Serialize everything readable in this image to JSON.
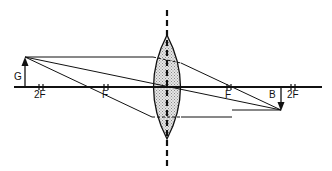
{
  "diagram": {
    "labels": {
      "object": "G",
      "image": "B",
      "focal_left": "F",
      "focal_right": "F",
      "double_focal_left": "2F",
      "double_focal_right": "2F"
    },
    "colors": {
      "line": "#111111",
      "lens_fill": "#cfcfcf",
      "background": "#ffffff"
    }
  }
}
